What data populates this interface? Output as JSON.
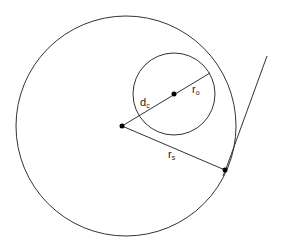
{
  "diagram": {
    "big_circle": {
      "cx": 126,
      "cy": 126,
      "r": 110
    },
    "small_circle": {
      "cx": 174,
      "cy": 94,
      "r": 41
    },
    "tangent_point": {
      "x": 225,
      "y": 170
    },
    "tangent_line": {
      "x1": 205,
      "y1": 246,
      "x2": 267,
      "y2": 56
    },
    "labels": {
      "dc": {
        "main": "d",
        "sub": "c"
      },
      "ro": {
        "main": "r",
        "sub": "o"
      },
      "rs": {
        "main": "r",
        "sub": "s"
      }
    },
    "stroke_color": "#333333"
  }
}
